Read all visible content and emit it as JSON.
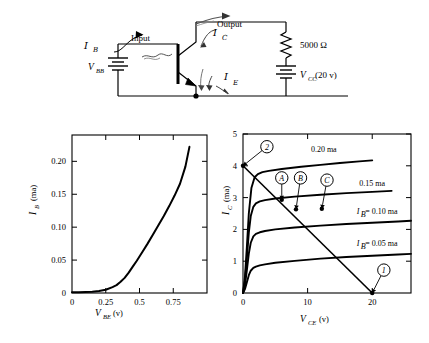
{
  "figure": {
    "background": "#ffffff",
    "ink": "#000000"
  },
  "circuit": {
    "title": "common-emitter-amplifier-circuit",
    "labels": {
      "ib": "I",
      "ib_sub": "B",
      "input": "Input",
      "ic": "I",
      "ic_sub": "C",
      "output": "Output",
      "ie": "I",
      "ie_sub": "E",
      "vbb": "V",
      "vbb_sub": "BB",
      "resistor": "5000 Ω",
      "vcc": "V",
      "vcc_sub": "CC",
      "vcc_value": "(20 v)"
    }
  },
  "chart_data": [
    {
      "id": "input-characteristic",
      "type": "line",
      "title": "",
      "xlabel": "V",
      "xlabel_sub": "BE",
      "xlabel_unit": "(v)",
      "ylabel": "I",
      "ylabel_sub": "B",
      "ylabel_unit": "(ma)",
      "xlim": [
        0,
        1.0
      ],
      "ylim": [
        0,
        0.24
      ],
      "xticks": [
        0,
        0.25,
        0.5,
        0.75
      ],
      "xticklabels": [
        "0",
        "0.25",
        "0.5",
        "0.75"
      ],
      "yticks": [
        0.05,
        0.1,
        0.15,
        0.2
      ],
      "yticklabels": [
        "0.05",
        "0.10",
        "0.15",
        "0.20"
      ],
      "grid": false,
      "legend": "none",
      "series": [
        {
          "name": "base-emitter diode curve",
          "x": [
            0.0,
            0.05,
            0.1,
            0.15,
            0.2,
            0.25,
            0.3,
            0.33,
            0.36,
            0.39,
            0.42,
            0.45,
            0.48,
            0.52,
            0.56,
            0.6,
            0.64,
            0.68,
            0.72,
            0.76,
            0.8,
            0.84,
            0.87
          ],
          "y": [
            0.001,
            0.0012,
            0.0015,
            0.002,
            0.003,
            0.005,
            0.009,
            0.012,
            0.017,
            0.023,
            0.031,
            0.04,
            0.049,
            0.062,
            0.075,
            0.089,
            0.103,
            0.117,
            0.132,
            0.148,
            0.166,
            0.192,
            0.222
          ]
        }
      ]
    },
    {
      "id": "output-characteristic",
      "type": "line",
      "title": "",
      "xlabel": "V",
      "xlabel_sub": "CE",
      "xlabel_unit": "(v)",
      "ylabel": "I",
      "ylabel_sub": "C",
      "ylabel_unit": "(ma)",
      "xlim": [
        0,
        26
      ],
      "ylim": [
        0,
        5
      ],
      "xticks": [
        0,
        10,
        20
      ],
      "xticklabels": [
        "0",
        "10",
        "20"
      ],
      "yticks": [
        0,
        1,
        2,
        3,
        4,
        5
      ],
      "yticklabels": [
        "0",
        "1",
        "2",
        "3",
        "4",
        "5"
      ],
      "grid": false,
      "legend": "inline-curve-labels",
      "series": [
        {
          "name": "IB = 0.05 ma",
          "label": "I",
          "label_sub": "B",
          "label_rest": " = 0.05 ma",
          "label_x": 18.0,
          "label_y": 1.48,
          "x": [
            0.0,
            0.3,
            0.6,
            0.9,
            1.2,
            1.6,
            2.0,
            2.6,
            3.4,
            5.0,
            8.0,
            12.0,
            16.0,
            20.0,
            24.0,
            26.0
          ],
          "y": [
            0.0,
            0.12,
            0.34,
            0.56,
            0.7,
            0.79,
            0.83,
            0.87,
            0.9,
            0.95,
            1.01,
            1.08,
            1.13,
            1.17,
            1.21,
            1.23
          ]
        },
        {
          "name": "IB = 0.10 ma",
          "label": "I",
          "label_sub": "B",
          "label_rest": " = 0.10 ma",
          "label_x": 18.0,
          "label_y": 2.48,
          "x": [
            0.0,
            0.3,
            0.6,
            0.9,
            1.2,
            1.6,
            2.0,
            2.6,
            3.4,
            5.0,
            8.0,
            12.0,
            16.0,
            20.0,
            24.0,
            26.0
          ],
          "y": [
            0.0,
            0.25,
            0.72,
            1.24,
            1.58,
            1.78,
            1.86,
            1.91,
            1.95,
            2.0,
            2.06,
            2.12,
            2.17,
            2.21,
            2.25,
            2.27
          ]
        },
        {
          "name": "0.15 ma",
          "label_rest": "0.15 ma",
          "label_x": 20.0,
          "label_y": 3.35,
          "x": [
            0.0,
            0.3,
            0.6,
            0.9,
            1.2,
            1.6,
            2.0,
            2.6,
            3.4,
            5.0,
            8.0,
            12.0,
            16.0,
            20.0,
            23.0
          ],
          "y": [
            0.0,
            0.38,
            1.1,
            1.9,
            2.42,
            2.71,
            2.82,
            2.88,
            2.92,
            2.97,
            3.03,
            3.09,
            3.14,
            3.18,
            3.21
          ]
        },
        {
          "name": "0.20 ma",
          "label_rest": "0.20 ma",
          "label_x": 12.5,
          "label_y": 4.43,
          "x": [
            0.0,
            0.3,
            0.6,
            0.9,
            1.3,
            1.8,
            2.3,
            3.0,
            4.0,
            6.0,
            9.0,
            12.0,
            15.0,
            18.0,
            20.0
          ],
          "y": [
            0.0,
            0.5,
            1.45,
            2.5,
            3.3,
            3.64,
            3.74,
            3.8,
            3.84,
            3.9,
            3.97,
            4.03,
            4.09,
            4.14,
            4.17
          ]
        }
      ],
      "load_line": {
        "name": "load-line",
        "x": [
          0,
          20
        ],
        "y": [
          4,
          0
        ]
      },
      "annotations": [
        {
          "id": "marker-1",
          "label": "1",
          "point_x": 20.0,
          "point_y": 0.0,
          "circle_x": 21.8,
          "circle_y": 0.72
        },
        {
          "id": "marker-2",
          "label": "2",
          "point_x": 0.0,
          "point_y": 4.0,
          "circle_x": 3.7,
          "circle_y": 4.6
        },
        {
          "id": "marker-a",
          "label": "A",
          "point_x": 6.0,
          "point_y": 2.93,
          "circle_x": 6.0,
          "circle_y": 3.62
        },
        {
          "id": "marker-b",
          "label": "B",
          "point_x": 8.2,
          "point_y": 2.63,
          "circle_x": 8.9,
          "circle_y": 3.62
        },
        {
          "id": "marker-c",
          "label": "C",
          "point_x": 12.2,
          "point_y": 2.65,
          "circle_x": 13.0,
          "circle_y": 3.55
        }
      ]
    }
  ]
}
